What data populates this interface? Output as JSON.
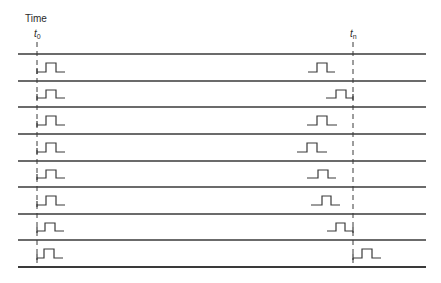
{
  "diagram": {
    "axis_label": "Time",
    "markers": [
      {
        "id": "t0",
        "symbol": "t",
        "subscript": "0",
        "x": 37
      },
      {
        "id": "tn",
        "symbol": "t",
        "subscript": "n",
        "x": 353
      }
    ],
    "colors": {
      "line": "#3a3a3a",
      "text": "#2a2a2a",
      "background": "#ffffff"
    },
    "row_separators_y": [
      54,
      81,
      107,
      134,
      161,
      187,
      214,
      240,
      267
    ],
    "line_x_range": [
      18,
      426
    ],
    "rows": [
      {
        "index": 1,
        "left_pulse": {
          "start": 37,
          "rise": 46,
          "fall": 56,
          "end": 65
        },
        "right_pulse": {
          "start": 308,
          "rise": 317,
          "fall": 327,
          "end": 335
        }
      },
      {
        "index": 2,
        "left_pulse": {
          "start": 37,
          "rise": 46,
          "fall": 56,
          "end": 65
        },
        "right_pulse": {
          "start": 326,
          "rise": 336,
          "fall": 346,
          "end": 353
        }
      },
      {
        "index": 3,
        "left_pulse": {
          "start": 37,
          "rise": 46,
          "fall": 56,
          "end": 65
        },
        "right_pulse": {
          "start": 307,
          "rise": 317,
          "fall": 327,
          "end": 337
        }
      },
      {
        "index": 4,
        "left_pulse": {
          "start": 37,
          "rise": 46,
          "fall": 56,
          "end": 65
        },
        "right_pulse": {
          "start": 297,
          "rise": 307,
          "fall": 317,
          "end": 327
        }
      },
      {
        "index": 5,
        "left_pulse": {
          "start": 37,
          "rise": 46,
          "fall": 56,
          "end": 65
        },
        "right_pulse": {
          "start": 307,
          "rise": 318,
          "fall": 328,
          "end": 336
        }
      },
      {
        "index": 6,
        "left_pulse": {
          "start": 37,
          "rise": 46,
          "fall": 56,
          "end": 65
        },
        "right_pulse": {
          "start": 311,
          "rise": 322,
          "fall": 331,
          "end": 340
        }
      },
      {
        "index": 7,
        "left_pulse": {
          "start": 37,
          "rise": 45,
          "fall": 55,
          "end": 64
        },
        "right_pulse": {
          "start": 327,
          "rise": 336,
          "fall": 345,
          "end": 353
        }
      },
      {
        "index": 8,
        "left_pulse": {
          "start": 37,
          "rise": 44,
          "fall": 54,
          "end": 63
        },
        "right_pulse": {
          "start": 353,
          "rise": 362,
          "fall": 372,
          "end": 381
        }
      }
    ]
  }
}
